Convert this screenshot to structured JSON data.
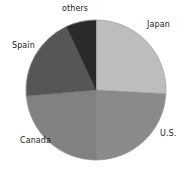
{
  "chart_data": {
    "type": "pie",
    "title": "",
    "subtitle": "",
    "xlabel": "",
    "ylabel": "",
    "legend_position": "none",
    "grid": false,
    "labels_outside": true,
    "categories": [
      "Japan",
      "U.S.",
      "Canada",
      "Spain",
      "others"
    ],
    "values": [
      26,
      24,
      24,
      19,
      7
    ],
    "unit": "%",
    "slices": [
      {
        "label": "Japan",
        "value": 26,
        "color": "#bdbdbd",
        "start_angle": 0,
        "end_angle": 93
      },
      {
        "label": "U.S.",
        "value": 24,
        "color": "#8a8a8a",
        "start_angle": 93,
        "end_angle": 180
      },
      {
        "label": "Canada",
        "value": 24,
        "color": "#818181",
        "start_angle": 180,
        "end_angle": 265
      },
      {
        "label": "Spain",
        "value": 19,
        "color": "#565656",
        "start_angle": 265,
        "end_angle": 335
      },
      {
        "label": "others",
        "value": 7,
        "color": "#2a2a2a",
        "start_angle": 335,
        "end_angle": 360
      }
    ],
    "geometry": {
      "center_x": 96,
      "center_y": 90,
      "radius": 70
    },
    "colors": {
      "japan": "#bdbdbd",
      "us": "#8a8a8a",
      "canada": "#818181",
      "spain": "#565656",
      "others": "#2a2a2a",
      "background": "#ffffff",
      "label_text": "#1a1a1a",
      "outline": "#9a9a9a"
    }
  },
  "labels": {
    "japan": "Japan",
    "us": "U.S.",
    "canada": "Canada",
    "spain": "Spain",
    "others": "others"
  }
}
